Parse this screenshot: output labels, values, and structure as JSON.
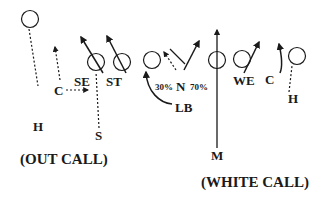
{
  "diagram": {
    "type": "football-play-diagram",
    "colors": {
      "ink": "#1a1a1a",
      "background": "#ffffff"
    },
    "players": [
      {
        "id": "H-left",
        "label": "H",
        "circle": [
          30,
          19
        ],
        "label_pos": [
          31,
          120
        ]
      },
      {
        "id": "C-left",
        "label": "C",
        "label_pos": [
          53,
          90
        ]
      },
      {
        "id": "SE",
        "label": "SE",
        "circle": [
          96,
          61
        ],
        "label_pos": [
          74,
          82
        ]
      },
      {
        "id": "ST",
        "label": "ST",
        "circle": [
          122,
          61
        ],
        "label_pos": [
          106,
          82
        ]
      },
      {
        "id": "S",
        "label": "S",
        "label_pos": [
          94,
          133
        ]
      },
      {
        "id": "LB-circle",
        "circle": [
          154,
          60
        ]
      },
      {
        "id": "N",
        "label": "N",
        "label_pos": [
          175,
          74
        ]
      },
      {
        "id": "center-circle",
        "circle": [
          213,
          60
        ]
      },
      {
        "id": "WE",
        "label": "WE",
        "circle": [
          242,
          59
        ],
        "label_pos": [
          233,
          80
        ]
      },
      {
        "id": "C-right",
        "label": "C",
        "label_pos": [
          265,
          78
        ]
      },
      {
        "id": "H-right",
        "label": "H",
        "circle": [
          297,
          56
        ],
        "label_pos": [
          287,
          96
        ]
      },
      {
        "id": "LB",
        "label": "LB",
        "label_pos": [
          172,
          104
        ]
      },
      {
        "id": "M",
        "label": "M",
        "label_pos": [
          210,
          151
        ]
      }
    ],
    "labels": {
      "h_left": "H",
      "c_left": "C",
      "se": "SE",
      "st": "ST",
      "s": "S",
      "pct_left": "30%",
      "n": "N",
      "pct_right": "70%",
      "we": "WE",
      "c_right": "C",
      "h_right": "H",
      "lb": "LB",
      "m": "M",
      "out_call": "(OUT CALL)",
      "white_call": "(WHITE CALL)"
    },
    "routes": [
      {
        "from": "H-left",
        "style": "dotted",
        "direction": "down to H"
      },
      {
        "from": "C-left",
        "style": "dotted",
        "direction": "up arrow"
      },
      {
        "from": "C-left",
        "style": "dotted",
        "direction": "right arrow toward SE"
      },
      {
        "from": "SE",
        "style": "solid",
        "direction": "up-left arrow"
      },
      {
        "from": "ST",
        "style": "solid",
        "direction": "up-left arrow"
      },
      {
        "from": "S",
        "style": "dotted",
        "direction": "up through SE"
      },
      {
        "from": "LB",
        "style": "solid-curve",
        "direction": "curve up to LB circle"
      },
      {
        "from": "N",
        "style": "dotted",
        "direction": "up-left arrow (30%)"
      },
      {
        "from": "N",
        "style": "solid",
        "direction": "up-right arrow (70%) crossing X"
      },
      {
        "from": "M",
        "style": "solid",
        "direction": "long vertical arrow up"
      },
      {
        "from": "WE",
        "style": "solid",
        "direction": "up-right arrow"
      },
      {
        "from": "C-right",
        "style": "solid-curve",
        "direction": "up arrow"
      },
      {
        "from": "H-right",
        "style": "dotted",
        "direction": "up toward circle"
      }
    ]
  }
}
